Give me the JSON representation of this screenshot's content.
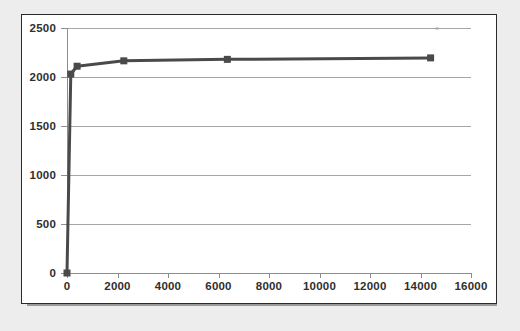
{
  "chart_data": {
    "type": "line",
    "title": "",
    "subtitle": "",
    "xlabel": "",
    "ylabel": "",
    "xlim": [
      0,
      16000
    ],
    "ylim": [
      0,
      2500
    ],
    "xticks": [
      0,
      2000,
      4000,
      6000,
      8000,
      10000,
      12000,
      14000,
      16000
    ],
    "yticks": [
      0,
      500,
      1000,
      1500,
      2000,
      2500
    ],
    "xtick_labels": [
      "0",
      "2000",
      "4000",
      "6000",
      "8000",
      "10000",
      "12000",
      "14000",
      "16000"
    ],
    "ytick_labels": [
      "0",
      "500",
      "1000",
      "1500",
      "2000",
      "2500"
    ],
    "grid": "horizontal",
    "legend": "none",
    "marker": "square",
    "series": [
      {
        "name": "series-1",
        "color": "#4a4a4a",
        "x": [
          0,
          150,
          400,
          2250,
          6350,
          14400
        ],
        "y": [
          0,
          2030,
          2110,
          2165,
          2180,
          2195
        ]
      }
    ],
    "annotations": []
  },
  "figure": {
    "panel_background": "#ffffff",
    "panel_border_color": "#2b2b2b",
    "page_background": "#ededed",
    "shadow_color": "#9a9a9a",
    "gridline_color": "#a6a6a6",
    "axis_color": "#8d8d8d",
    "tick_label_color": "#2f2f2f"
  }
}
